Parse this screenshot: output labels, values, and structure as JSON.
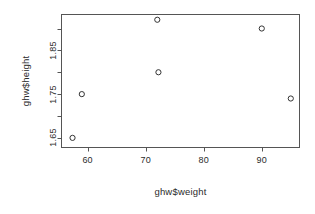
{
  "chart_data": {
    "type": "scatter",
    "title": "",
    "xlabel": "ghw$weight",
    "ylabel": "ghw$height",
    "xlim": [
      55.5,
      96.5
    ],
    "ylim": [
      1.628,
      1.932
    ],
    "grid": false,
    "legend": null,
    "point_symbol": "open-circle",
    "point_color": "#333333",
    "x": [
      57.4,
      59.0,
      72.0,
      72.2,
      90.0,
      95.0
    ],
    "y": [
      1.65,
      1.75,
      1.92,
      1.8,
      1.9,
      1.74
    ],
    "points": [
      {
        "x": 57.4,
        "y": 1.65
      },
      {
        "x": 59.0,
        "y": 1.75
      },
      {
        "x": 72.0,
        "y": 1.92
      },
      {
        "x": 72.2,
        "y": 1.8
      },
      {
        "x": 90.0,
        "y": 1.9
      },
      {
        "x": 95.0,
        "y": 1.74
      }
    ],
    "xticks": [
      60,
      70,
      80,
      90
    ],
    "xtick_labels": [
      "60",
      "70",
      "80",
      "90"
    ],
    "yticks": [
      1.65,
      1.7,
      1.75,
      1.8,
      1.85,
      1.9
    ],
    "ytick_labels": [
      "1.65",
      "",
      "1.75",
      "",
      "1.85",
      ""
    ],
    "ylabeled_ticks": [
      {
        "value": 1.85,
        "label": "1.85"
      },
      {
        "value": 1.75,
        "label": "1.75"
      },
      {
        "value": 1.65,
        "label": "1.65"
      }
    ]
  },
  "axes": {
    "x_title": "ghw$weight",
    "y_title": "ghw$height",
    "x_labels": [
      "60",
      "70",
      "80",
      "90"
    ],
    "y_labels": [
      "1.85",
      "1.75",
      "1.65"
    ]
  },
  "style": {
    "frame_color": "#555555",
    "text_color": "#2b2b2b",
    "background": "#ffffff"
  }
}
